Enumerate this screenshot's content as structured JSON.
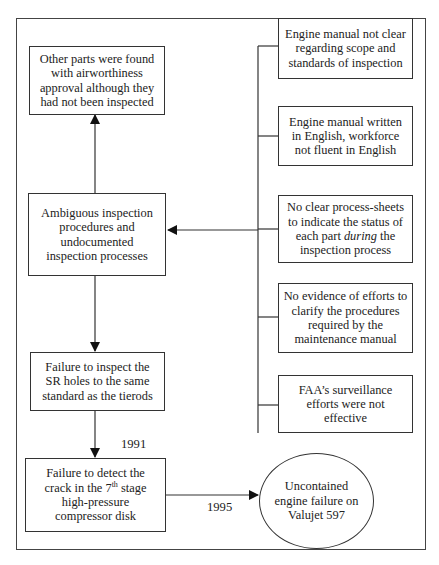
{
  "diagram": {
    "type": "cause-effect flowchart",
    "center_column": {
      "other_parts": "Other parts were found with airworthiness approval although they had not been inspected",
      "ambiguous": "Ambiguous inspection procedures and undocumented inspection processes",
      "failure_sr": "Failure to inspect the SR holes to the same standard as the tierods",
      "failure_detect": {
        "prefix": "Failure to detect the crack in the 7",
        "sup": "th",
        "suffix": " stage high-pressure compressor disk"
      }
    },
    "contributing_factors": [
      {
        "text": "Engine manual not clear regarding scope and standards of inspection"
      },
      {
        "text": "Engine manual written in English, workforce not fluent in English"
      },
      {
        "text_pre": "No clear process-sheets to indicate the status of each part ",
        "text_em": "during",
        "text_post": " the inspection process"
      },
      {
        "text": "No evidence of efforts to clarify the procedures required by the maintenance manual"
      },
      {
        "text": "FAA’s surveillance efforts were not effective"
      }
    ],
    "outcome": "Uncontained engine failure on Valujet 597",
    "year_labels": {
      "detect": "1991",
      "outcome": "1995"
    }
  }
}
